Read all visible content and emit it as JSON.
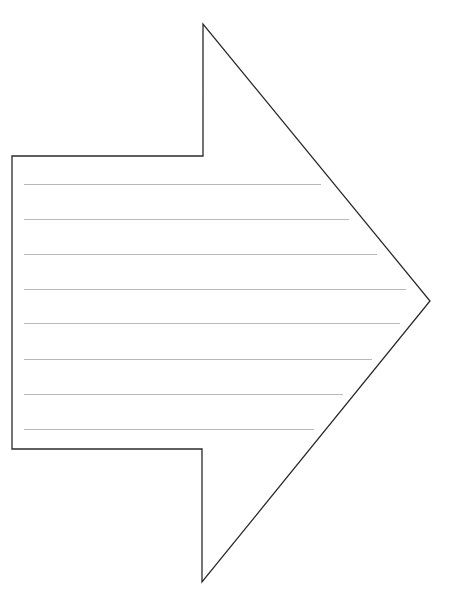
{
  "page": {
    "width": 457,
    "height": 613,
    "background": "#ffffff"
  },
  "arrow": {
    "stroke": "#2a2a2a",
    "stroke_width": 1.3,
    "fill": "#ffffff",
    "points": [
      [
        12,
        156
      ],
      [
        203,
        156
      ],
      [
        203,
        24
      ],
      [
        430,
        301
      ],
      [
        202,
        582
      ],
      [
        202,
        449
      ],
      [
        12,
        449
      ]
    ]
  },
  "writing_lines": {
    "color": "#b8b8b8",
    "stroke_width": 1,
    "items": [
      {
        "y": 184,
        "x1": 24,
        "x2": 321
      },
      {
        "y": 219,
        "x1": 24,
        "x2": 349
      },
      {
        "y": 254,
        "x1": 24,
        "x2": 377
      },
      {
        "y": 289,
        "x1": 24,
        "x2": 406
      },
      {
        "y": 323,
        "x1": 24,
        "x2": 400
      },
      {
        "y": 359,
        "x1": 24,
        "x2": 372
      },
      {
        "y": 394,
        "x1": 24,
        "x2": 343
      },
      {
        "y": 429,
        "x1": 24,
        "x2": 314
      }
    ]
  }
}
